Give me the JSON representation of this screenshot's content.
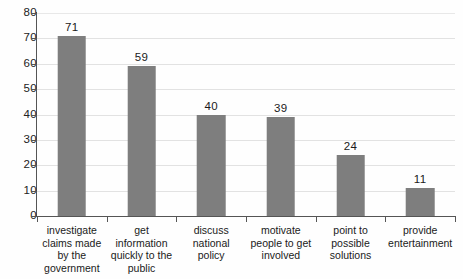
{
  "chart_data": {
    "type": "bar",
    "title": "",
    "subtitle": "",
    "xlabel": "",
    "ylabel": "",
    "ylim": [
      0,
      80
    ],
    "yticks": [
      0,
      10,
      20,
      30,
      40,
      50,
      60,
      70,
      80
    ],
    "ytick_labels": [
      "0",
      "10",
      "20",
      "30",
      "40",
      "50",
      "60",
      "70",
      "80"
    ],
    "grid": "horizontal",
    "legend": "none",
    "bar_color": "#7e7e7e",
    "gridline_color": "#e2e2e2",
    "axis_color": "#555555",
    "categories": [
      "investigate claims made by the government",
      "get information quickly to the public",
      "discuss national policy",
      "motivate people to get involved",
      "point to possible solutions",
      "provide entertainment"
    ],
    "category_lines": [
      [
        "investigate",
        "claims made",
        "by the",
        "government"
      ],
      [
        "get",
        "information",
        "quickly to the",
        "public"
      ],
      [
        "discuss",
        "national",
        "policy"
      ],
      [
        "motivate",
        "people to get",
        "involved"
      ],
      [
        "point to",
        "possible",
        "solutions"
      ],
      [
        "provide",
        "entertainment"
      ]
    ],
    "values": [
      71,
      59,
      40,
      39,
      24,
      11
    ],
    "value_labels": [
      "71",
      "59",
      "40",
      "39",
      "24",
      "11"
    ]
  }
}
